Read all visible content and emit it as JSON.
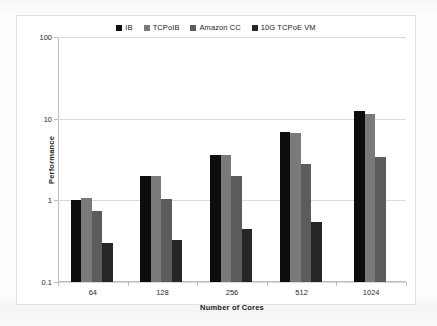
{
  "chart_data": {
    "type": "bar",
    "title": "",
    "xlabel": "Number of Cores",
    "ylabel": "Performance",
    "categories": [
      "64",
      "128",
      "256",
      "512",
      "1024"
    ],
    "yscale": "log",
    "ylim": [
      0.1,
      100
    ],
    "yticks": [
      0.1,
      1,
      10,
      100
    ],
    "ytick_labels": [
      "0.1",
      "1",
      "10",
      "100"
    ],
    "grid": true,
    "legend_position": "top-center",
    "series": [
      {
        "name": "IB",
        "color": "#0d0d0d",
        "values": [
          1.02,
          2.0,
          3.6,
          6.8,
          12.5
        ]
      },
      {
        "name": "TCPoIB",
        "color": "#7a7a7a",
        "values": [
          1.08,
          2.0,
          3.6,
          6.6,
          11.5
        ]
      },
      {
        "name": "Amazon CC",
        "color": "#5c5c5c",
        "values": [
          0.75,
          1.05,
          2.0,
          2.8,
          3.4
        ]
      },
      {
        "name": "10G TCPoE VM",
        "color": "#262626",
        "values": [
          0.3,
          0.33,
          0.45,
          0.55,
          null
        ]
      }
    ]
  },
  "legend": {
    "items": [
      {
        "label": "IB",
        "swatch": "#0d0d0d"
      },
      {
        "label": "TCPoIB",
        "swatch": "#7a7a7a"
      },
      {
        "label": "Amazon CC",
        "swatch": "#5c5c5c"
      },
      {
        "label": "10G TCPoE VM",
        "swatch": "#262626"
      }
    ]
  }
}
